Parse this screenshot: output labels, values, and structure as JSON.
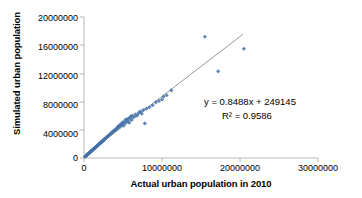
{
  "chart_data": {
    "type": "scatter",
    "title": "",
    "xlabel": "Actual urban population in 2010",
    "ylabel": "Simulated urban population",
    "xlim": [
      0,
      30000000
    ],
    "ylim": [
      0,
      20000000
    ],
    "xticks": [
      "0",
      "10000000",
      "20000000",
      "30000000"
    ],
    "xtick_values": [
      0,
      10000000,
      20000000,
      30000000
    ],
    "yticks": [
      "0",
      "4000000",
      "8000000",
      "12000000",
      "16000000",
      "20000000"
    ],
    "ytick_values": [
      0,
      4000000,
      8000000,
      12000000,
      16000000,
      20000000
    ],
    "grid": false,
    "legend": "none",
    "marker_color": "#4472a8",
    "trendline_color": "#808080",
    "annotations": {
      "equation": "y = 0.8488x + 249145",
      "r_squared": "R² = 0.9586"
    },
    "trendline": {
      "slope": 0.8488,
      "intercept": 249145,
      "x_start": 0,
      "x_end": 20400000
    },
    "series": [
      {
        "name": "Cities",
        "points": [
          [
            120000,
            180000
          ],
          [
            180000,
            250000
          ],
          [
            240000,
            300000
          ],
          [
            300000,
            330000
          ],
          [
            340000,
            420000
          ],
          [
            400000,
            400000
          ],
          [
            450000,
            520000
          ],
          [
            500000,
            560000
          ],
          [
            560000,
            600000
          ],
          [
            600000,
            640000
          ],
          [
            650000,
            700000
          ],
          [
            700000,
            700000
          ],
          [
            760000,
            820000
          ],
          [
            800000,
            860000
          ],
          [
            860000,
            900000
          ],
          [
            900000,
            950000
          ],
          [
            960000,
            1000000
          ],
          [
            1000000,
            1050000
          ],
          [
            1060000,
            1080000
          ],
          [
            1100000,
            1150000
          ],
          [
            1160000,
            1200000
          ],
          [
            1200000,
            1230000
          ],
          [
            1260000,
            1300000
          ],
          [
            1300000,
            1340000
          ],
          [
            1360000,
            1400000
          ],
          [
            1400000,
            1420000
          ],
          [
            1460000,
            1500000
          ],
          [
            1500000,
            1540000
          ],
          [
            1560000,
            1600000
          ],
          [
            1600000,
            1630000
          ],
          [
            1660000,
            1700000
          ],
          [
            1700000,
            1720000
          ],
          [
            1760000,
            1800000
          ],
          [
            1800000,
            1840000
          ],
          [
            1860000,
            1900000
          ],
          [
            1900000,
            1930000
          ],
          [
            1960000,
            2000000
          ],
          [
            2000000,
            2050000
          ],
          [
            2060000,
            2080000
          ],
          [
            2100000,
            2150000
          ],
          [
            2160000,
            2200000
          ],
          [
            2200000,
            2220000
          ],
          [
            2260000,
            2300000
          ],
          [
            2300000,
            2340000
          ],
          [
            2360000,
            2400000
          ],
          [
            2400000,
            2420000
          ],
          [
            2460000,
            2500000
          ],
          [
            2500000,
            2540000
          ],
          [
            2560000,
            2600000
          ],
          [
            2600000,
            2620000
          ],
          [
            2700000,
            2750000
          ],
          [
            2800000,
            2800000
          ],
          [
            2900000,
            2950000
          ],
          [
            3000000,
            3000000
          ],
          [
            3100000,
            3150000
          ],
          [
            3200000,
            3200000
          ],
          [
            3300000,
            3350000
          ],
          [
            3400000,
            3400000
          ],
          [
            3500000,
            3550000
          ],
          [
            3600000,
            3600000
          ],
          [
            3700000,
            3750000
          ],
          [
            3800000,
            3800000
          ],
          [
            3900000,
            3950000
          ],
          [
            4000000,
            3900000
          ],
          [
            4100000,
            4100000
          ],
          [
            4200000,
            4150000
          ],
          [
            4300000,
            4400000
          ],
          [
            4400000,
            4300000
          ],
          [
            4500000,
            4600000
          ],
          [
            4600000,
            4500000
          ],
          [
            4700000,
            4800000
          ],
          [
            4800000,
            4700000
          ],
          [
            4900000,
            4900000
          ],
          [
            5000000,
            5100000
          ],
          [
            5100000,
            4600000
          ],
          [
            5200000,
            5000000
          ],
          [
            5300000,
            5400000
          ],
          [
            5400000,
            5100000
          ],
          [
            5500000,
            5500000
          ],
          [
            5600000,
            5300000
          ],
          [
            5700000,
            5600000
          ],
          [
            5800000,
            5000000
          ],
          [
            5900000,
            5700000
          ],
          [
            6000000,
            5900000
          ],
          [
            6100000,
            5400000
          ],
          [
            6200000,
            6000000
          ],
          [
            6400000,
            5800000
          ],
          [
            6600000,
            6200000
          ],
          [
            6800000,
            6000000
          ],
          [
            7000000,
            6400000
          ],
          [
            7200000,
            6600000
          ],
          [
            7400000,
            6300000
          ],
          [
            7600000,
            6800000
          ],
          [
            7800000,
            4900000
          ],
          [
            8000000,
            7000000
          ],
          [
            8400000,
            7200000
          ],
          [
            8800000,
            7500000
          ],
          [
            9200000,
            7900000
          ],
          [
            9600000,
            8100000
          ],
          [
            10000000,
            8300000
          ],
          [
            10200000,
            8700000
          ],
          [
            10600000,
            8900000
          ],
          [
            11200000,
            9600000
          ],
          [
            15500000,
            17200000
          ],
          [
            17200000,
            12300000
          ],
          [
            20500000,
            15500000
          ]
        ]
      }
    ]
  }
}
